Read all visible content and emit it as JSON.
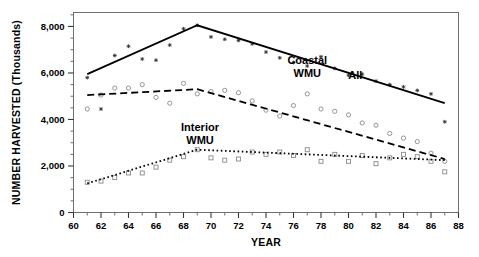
{
  "chart_data": {
    "type": "scatter",
    "title": "",
    "xlabel": "YEAR",
    "ylabel": "NUMBER HARVESTED (Thousands)",
    "xlim": [
      60,
      88
    ],
    "ylim": [
      0,
      8600
    ],
    "xticks": [
      60,
      62,
      64,
      66,
      68,
      70,
      72,
      74,
      76,
      78,
      80,
      82,
      84,
      86,
      88
    ],
    "xtick_labels": [
      "60",
      "62",
      "64",
      "66",
      "68",
      "70",
      "72",
      "74",
      "76",
      "78",
      "80",
      "82",
      "84",
      "86",
      "88"
    ],
    "xminor_step": 1,
    "yticks": [
      0,
      2000,
      4000,
      6000,
      8000
    ],
    "ytick_labels": [
      "0",
      "2,000",
      "4,000",
      "6,000",
      "8,000"
    ],
    "yminor_step": 500,
    "grid": false,
    "legend_position": "inline-annotations",
    "frame": true,
    "series": [
      {
        "name": "All",
        "label": "All",
        "label_x": 80.5,
        "label_y": 5750,
        "marker": "star",
        "marker_color": "#333333",
        "line_style": "solid",
        "line_color": "#000000",
        "x": [
          61,
          62,
          63,
          64,
          65,
          66,
          67,
          68,
          69,
          70,
          71,
          72,
          73,
          74,
          75,
          76,
          77,
          78,
          79,
          80,
          81,
          82,
          83,
          84,
          85,
          86,
          87
        ],
        "y": [
          5800,
          4450,
          6750,
          7150,
          6600,
          6550,
          7200,
          7900,
          8050,
          7550,
          7450,
          7400,
          7250,
          6900,
          6650,
          6450,
          6300,
          6700,
          6200,
          5900,
          5950,
          5650,
          5500,
          5400,
          5250,
          5100,
          3900
        ]
      },
      {
        "name": "Coastal WMU",
        "label": "Coastal\nWMU",
        "label_x": 77.0,
        "label_y": 6400,
        "marker": "circle",
        "marker_color": "#8a8a8a",
        "line_style": "dashed",
        "line_color": "#000000",
        "x": [
          61,
          62,
          63,
          64,
          65,
          66,
          67,
          68,
          69,
          70,
          71,
          72,
          73,
          74,
          75,
          76,
          77,
          78,
          79,
          80,
          81,
          82,
          83,
          84,
          85,
          86,
          87
        ],
        "y": [
          4450,
          5050,
          5350,
          5350,
          5500,
          4950,
          4700,
          5550,
          5100,
          5200,
          5250,
          5150,
          4800,
          4400,
          4150,
          4600,
          5100,
          4450,
          4350,
          4200,
          3850,
          3750,
          3400,
          3200,
          3050,
          2550,
          2200
        ]
      },
      {
        "name": "Interior WMU",
        "label": "Interior\nWMU",
        "label_x": 69.2,
        "label_y": 3500,
        "marker": "square",
        "marker_color": "#8a8a8a",
        "line_style": "dotted",
        "line_color": "#000000",
        "x": [
          61,
          62,
          63,
          64,
          65,
          66,
          67,
          68,
          69,
          70,
          71,
          72,
          73,
          74,
          75,
          76,
          77,
          78,
          79,
          80,
          81,
          82,
          83,
          84,
          85,
          86,
          87
        ],
        "y": [
          1300,
          1350,
          1500,
          1700,
          1700,
          1950,
          2250,
          2400,
          2700,
          2350,
          2250,
          2300,
          2600,
          2500,
          2600,
          2450,
          2700,
          2200,
          2500,
          2200,
          2450,
          2100,
          2350,
          2500,
          2400,
          2200,
          1750
        ]
      }
    ],
    "trend_lines": [
      {
        "series": "All",
        "style": "solid",
        "width": 1.8,
        "points": [
          [
            61,
            5950
          ],
          [
            69,
            8050
          ],
          [
            87,
            4700
          ]
        ]
      },
      {
        "series": "Coastal WMU",
        "style": "dashed",
        "width": 1.8,
        "points": [
          [
            61,
            5050
          ],
          [
            69,
            5300
          ],
          [
            87,
            2300
          ]
        ]
      },
      {
        "series": "Interior WMU",
        "style": "dotted",
        "width": 1.8,
        "points": [
          [
            61,
            1250
          ],
          [
            69,
            2700
          ],
          [
            87,
            2250
          ]
        ]
      }
    ]
  }
}
